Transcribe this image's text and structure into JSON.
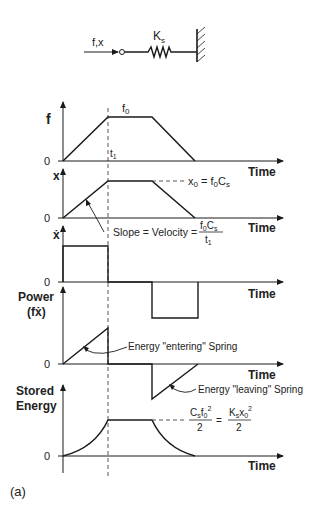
{
  "schematic": {
    "input_label": "f,x",
    "spring_label": "K",
    "spring_subscript": "s"
  },
  "panels": [
    {
      "id": "force",
      "ylabel": "f",
      "zero": "0",
      "xlabel": "Time",
      "plateau_label": "f",
      "plateau_sub": "0",
      "t_label": "t",
      "t_sub": "1"
    },
    {
      "id": "displacement",
      "ylabel": "x",
      "zero": "0",
      "xlabel": "Time",
      "annotation": "x0 = f0Cs",
      "slope_label": "Slope = Velocity =",
      "slope_num": "f0Cs",
      "slope_den": "t1"
    },
    {
      "id": "velocity",
      "ylabel": "ẋ",
      "zero": "0",
      "xlabel": "Time"
    },
    {
      "id": "power",
      "ylabel_line1": "Power",
      "ylabel_line2": "(fẋ)",
      "zero": "0",
      "xlabel": "Time",
      "entering_label": "Energy \"entering\" Spring",
      "leaving_label": "Energy \"leaving\" Spring"
    },
    {
      "id": "stored_energy",
      "ylabel_line1": "Stored",
      "ylabel_line2": "Energy",
      "zero": "0",
      "xlabel": "Time",
      "formula_left_num": "Csf0²",
      "formula_left_den": "2",
      "equals": "=",
      "formula_right_num": "Ksx0²",
      "formula_right_den": "2"
    }
  ],
  "caption": "(a)",
  "colors": {
    "line": "#1a1a1a",
    "text": "#222222",
    "background": "#ffffff"
  }
}
